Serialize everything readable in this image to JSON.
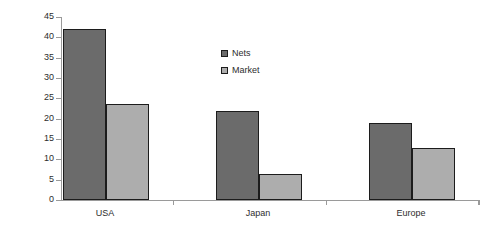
{
  "chart_data": {
    "type": "bar",
    "title": "",
    "subtitle": "",
    "xlabel": "",
    "ylabel": "",
    "categories": [
      "USA",
      "Japan",
      "Europe"
    ],
    "series": [
      {
        "name": "Nets",
        "values": [
          42,
          22,
          19
        ],
        "color": "#6b6b6b"
      },
      {
        "name": "Market",
        "values": [
          23.5,
          6.5,
          12.7
        ],
        "color": "#adadad"
      }
    ],
    "ylim": [
      0,
      45
    ],
    "ytick_step": 5,
    "yticks": [
      0,
      5,
      10,
      15,
      20,
      25,
      30,
      35,
      40,
      45
    ],
    "ytick_labels": [
      "0",
      "5",
      "10",
      "15",
      "20",
      "25",
      "30",
      "35",
      "40",
      "45"
    ],
    "grid": false,
    "legend": {
      "position": "upper-center",
      "entries": [
        "Nets",
        "Market"
      ]
    },
    "bar_border_color": "#1c1c1c",
    "axis_color": "#9a9a9a",
    "background": "#ffffff"
  }
}
